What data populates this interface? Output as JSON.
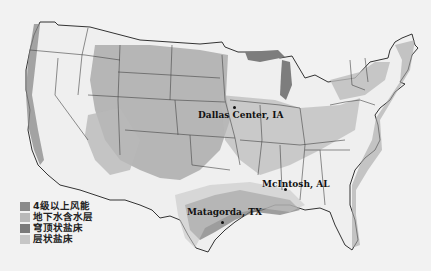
{
  "map": {
    "region": "Contiguous United States",
    "colors": {
      "background": "#f2f2f2",
      "land": "#efefef",
      "border": "#333333",
      "wind_class4": "#8a8a8a",
      "aquifer": "#b9b9b9",
      "salt_dome": "#7a7a7a",
      "bedded_salt": "#c6c6c6"
    }
  },
  "legend": {
    "items": [
      {
        "label": "4级以上风能",
        "color": "#8a8a8a"
      },
      {
        "label": "地下水含水层",
        "color": "#b9b9b9"
      },
      {
        "label": "穹顶状盐床",
        "color": "#7a7a7a"
      },
      {
        "label": "层状盐床",
        "color": "#c6c6c6"
      }
    ]
  },
  "cities": [
    {
      "label": "Dallas Center, IA"
    },
    {
      "label": "McIntosh, AL"
    },
    {
      "label": "Matagorda, TX"
    }
  ]
}
